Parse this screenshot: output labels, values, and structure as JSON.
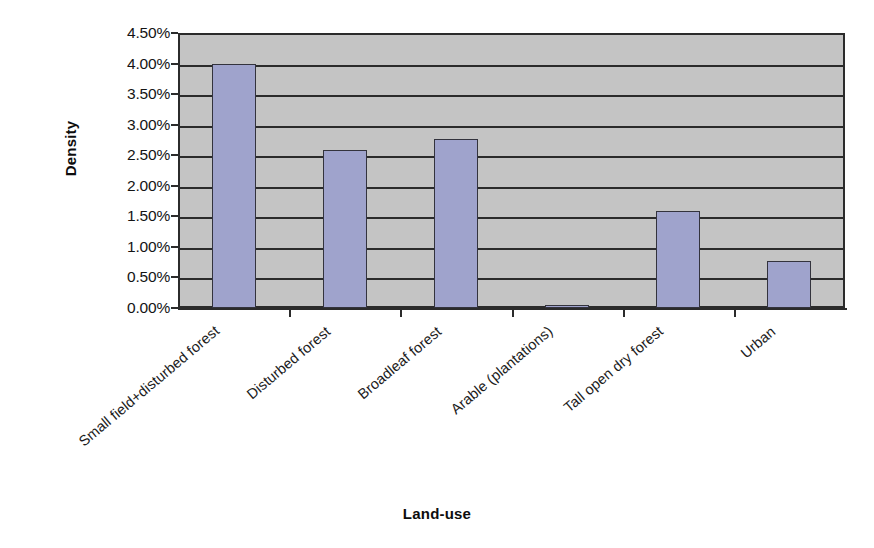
{
  "chart_data": {
    "type": "bar",
    "title": "",
    "xlabel": "Land-use",
    "ylabel": "Density",
    "categories": [
      "Small field+disturbed forest",
      "Disturbed forest",
      "Broadleaf forest",
      "Arable (plantations)",
      "Tall open dry forest",
      "Urban"
    ],
    "values": [
      4.0,
      2.58,
      2.77,
      0.03,
      1.59,
      0.77
    ],
    "value_unit": "%",
    "tick_labels": [
      "4.50%",
      "4.00%",
      "3.50%",
      "3.00%",
      "2.50%",
      "2.00%",
      "1.50%",
      "1.00%",
      "0.50%",
      "0.00%"
    ],
    "tick_values": [
      4.5,
      4.0,
      3.5,
      3.0,
      2.5,
      2.0,
      1.5,
      1.0,
      0.5,
      0.0
    ],
    "ylim": [
      0,
      4.5
    ],
    "grid": true,
    "legend": false,
    "legend_position": "none",
    "colors": {
      "bar_fill": "#9fa3cc",
      "bar_border": "#33333d",
      "plot_background": "#c4c4c4",
      "gridline": "#2b2b2b",
      "axis": "#2b2b2b",
      "page_background": "#ffffff",
      "text": "#1a1a1a"
    }
  }
}
